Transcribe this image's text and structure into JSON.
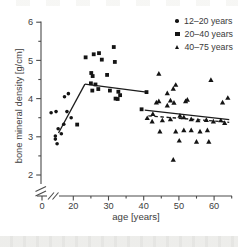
{
  "colors": {
    "marker": "#141414",
    "trend_line": "#1c1c1c",
    "axis": "#4a4a4a",
    "tick_text": "#3d3d3d",
    "top_strip": "#f2f2ef",
    "bottom_strip": "#e9e9e6"
  },
  "chart_data": {
    "type": "scatter",
    "title": "",
    "xlabel": "age [years]",
    "ylabel": "bone mineral density [g/cm]",
    "x_ticks": [
      0,
      20,
      30,
      40,
      50,
      60
    ],
    "x_minor_ticks": [
      25,
      35,
      45,
      55,
      65
    ],
    "y_ticks": [
      2,
      3,
      4,
      5,
      6
    ],
    "y_minor_ticks": [
      2.5,
      3.5,
      4.5,
      5.5
    ],
    "ylim": [
      2,
      6
    ],
    "axis_break_x": true,
    "axis_break_y": true,
    "grid": false,
    "legend_position": "top-right",
    "series": [
      {
        "name": "12–20 years",
        "marker": "circle",
        "points": [
          [
            13.7,
            3.63
          ],
          [
            15.1,
            3.66
          ],
          [
            18.2,
            3.66
          ],
          [
            19.4,
            3.5
          ],
          [
            17.3,
            3.33
          ],
          [
            15.7,
            3.21
          ],
          [
            16.6,
            3.08
          ],
          [
            14.9,
            3.02
          ],
          [
            14.9,
            2.94
          ],
          [
            15.4,
            2.82
          ],
          [
            17.5,
            4.05
          ],
          [
            18.6,
            4.13
          ]
        ]
      },
      {
        "name": "20–40 years",
        "marker": "square",
        "points": [
          [
            21.1,
            3.32
          ],
          [
            23.5,
            5.08
          ],
          [
            25.8,
            5.16
          ],
          [
            27.3,
            5.19
          ],
          [
            28.1,
            5.02
          ],
          [
            31.5,
            5.35
          ],
          [
            31.8,
            4.96
          ],
          [
            25.1,
            4.67
          ],
          [
            25.5,
            4.59
          ],
          [
            29.6,
            4.62
          ],
          [
            25.0,
            4.4
          ],
          [
            26.3,
            4.37
          ],
          [
            27.1,
            4.25
          ],
          [
            25.4,
            4.21
          ],
          [
            30.4,
            4.21
          ],
          [
            32.8,
            4.18
          ],
          [
            33.3,
            4.09
          ],
          [
            32.0,
            4.0
          ],
          [
            32.6,
            3.99
          ],
          [
            39.4,
            3.72
          ],
          [
            40.8,
            4.17
          ]
        ]
      },
      {
        "name": "40–75 years",
        "marker": "triangle",
        "points": [
          [
            44.3,
            4.65
          ],
          [
            48.4,
            4.26
          ],
          [
            49.1,
            4.36
          ],
          [
            59.1,
            4.49
          ],
          [
            46.7,
            4.14
          ],
          [
            63.9,
            4.02
          ],
          [
            43.6,
            3.9
          ],
          [
            44.3,
            3.93
          ],
          [
            46.7,
            3.82
          ],
          [
            47.6,
            3.95
          ],
          [
            48.6,
            3.89
          ],
          [
            51.9,
            3.93
          ],
          [
            52.4,
            3.97
          ],
          [
            62.4,
            3.9
          ],
          [
            41.0,
            3.49
          ],
          [
            42.4,
            3.4
          ],
          [
            42.6,
            3.6
          ],
          [
            45.3,
            3.43
          ],
          [
            47.6,
            3.46
          ],
          [
            50.3,
            3.55
          ],
          [
            51.4,
            3.51
          ],
          [
            53.5,
            3.46
          ],
          [
            55.4,
            3.43
          ],
          [
            57.8,
            3.44
          ],
          [
            59.8,
            3.4
          ],
          [
            61.9,
            3.43
          ],
          [
            63.0,
            3.36
          ],
          [
            44.6,
            3.14
          ],
          [
            49.1,
            3.14
          ],
          [
            51.4,
            3.17
          ],
          [
            53.5,
            3.17
          ],
          [
            56.0,
            3.14
          ],
          [
            58.1,
            3.17
          ],
          [
            50.1,
            2.9
          ],
          [
            55.0,
            2.87
          ],
          [
            58.5,
            2.87
          ],
          [
            48.4,
            2.4
          ]
        ]
      }
    ],
    "trend_lines": [
      {
        "style": "solid",
        "from": [
          15.8,
          3.1
        ],
        "to": [
          23.3,
          4.38
        ]
      },
      {
        "style": "solid",
        "from": [
          23.3,
          4.38
        ],
        "to": [
          40.8,
          4.17
        ]
      },
      {
        "style": "solid",
        "from": [
          40.3,
          3.7
        ],
        "to": [
          64.3,
          3.45
        ]
      },
      {
        "style": "dashed",
        "from": [
          41.3,
          3.55
        ],
        "to": [
          64.3,
          3.38
        ]
      }
    ]
  }
}
